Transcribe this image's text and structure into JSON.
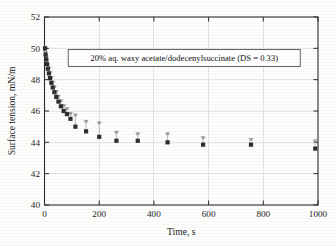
{
  "chart_data": {
    "type": "scatter",
    "title": "",
    "xlabel": "Time, s",
    "ylabel": "Surface tension, mN/m",
    "xlim": [
      0,
      1000
    ],
    "ylim": [
      40,
      52
    ],
    "xticks": [
      0,
      200,
      400,
      600,
      800,
      1000
    ],
    "yticks": [
      40,
      42,
      44,
      46,
      48,
      50,
      52
    ],
    "grid": true,
    "legend_position": "none",
    "annotations": [
      "20% aq. waxy acetate/dodecenylsuccinate (DS = 0.33)"
    ],
    "series": [
      {
        "name": "Dynamic surface tension",
        "marker": "square",
        "color": "#2e2e2e",
        "errorbar_color": "#a8a8a8",
        "x": [
          2,
          4,
          6,
          9,
          12,
          16,
          20,
          25,
          30,
          36,
          43,
          51,
          60,
          70,
          82,
          95,
          113,
          152,
          200,
          263,
          341,
          450,
          580,
          755,
          990
        ],
        "y": [
          50.0,
          49.6,
          49.3,
          49.0,
          48.7,
          48.4,
          48.1,
          47.8,
          47.5,
          47.2,
          46.9,
          46.6,
          46.3,
          46.0,
          45.8,
          45.5,
          45.0,
          44.7,
          44.35,
          44.1,
          44.1,
          44.0,
          43.85,
          43.85,
          43.6
        ],
        "yerr_high": [
          50.1,
          49.8,
          49.5,
          49.3,
          49.0,
          48.8,
          48.5,
          48.2,
          47.9,
          47.6,
          47.3,
          47.0,
          46.7,
          46.4,
          46.2,
          45.9,
          45.8,
          45.4,
          45.3,
          44.7,
          44.6,
          44.6,
          44.35,
          44.25,
          44.15
        ]
      }
    ]
  }
}
